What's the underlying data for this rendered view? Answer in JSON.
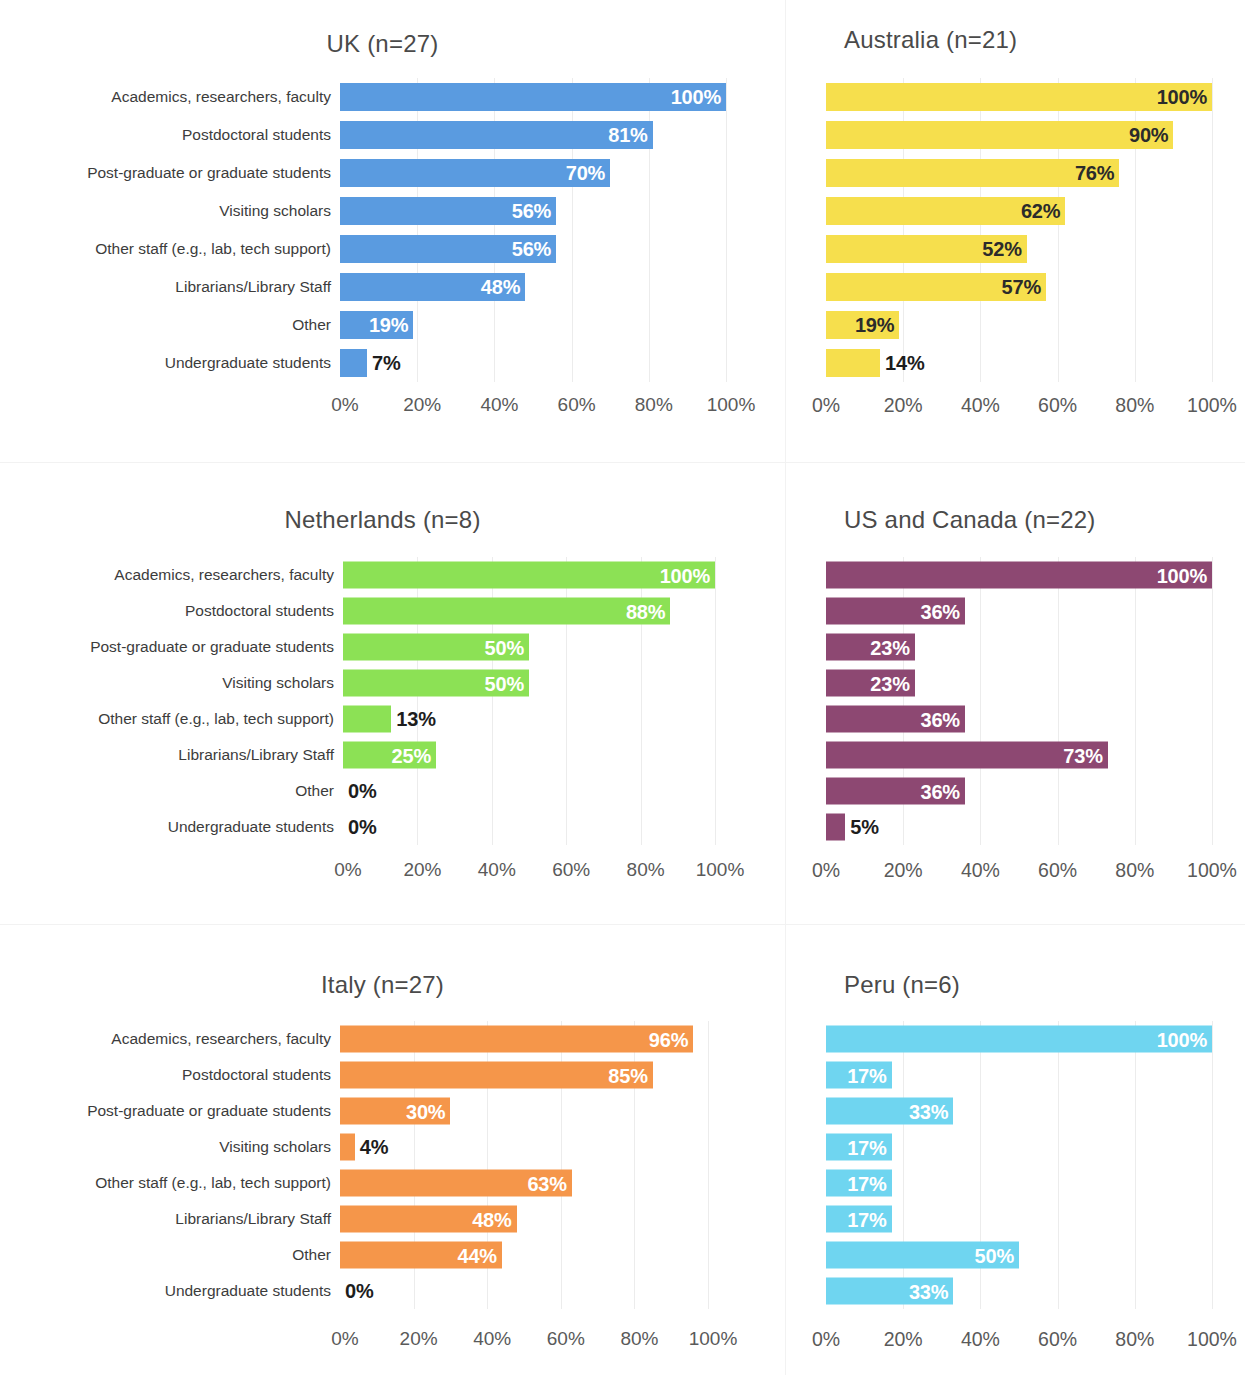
{
  "chart_data": {
    "type": "bar",
    "orientation": "horizontal",
    "title": "",
    "xlabel": "",
    "ylabel": "",
    "xlim": [
      0,
      100
    ],
    "xticks": [
      "0%",
      "20%",
      "40%",
      "60%",
      "80%",
      "100%"
    ],
    "xtick_values": [
      0,
      20,
      40,
      60,
      80,
      100
    ],
    "grid": "vertical-only",
    "legend": "none",
    "value_suffix": "%",
    "categories": [
      "Academics, researchers, faculty",
      "Postdoctoral students",
      "Post-graduate or graduate students",
      "Visiting scholars",
      "Other staff (e.g., lab, tech support)",
      "Librarians/Library Staff",
      "Other",
      "Undergraduate students"
    ],
    "panels": [
      {
        "title": "UK (n=27)",
        "region": "UK",
        "n": 27,
        "color": "#5a9be0",
        "label_color": "white",
        "values": [
          100,
          81,
          70,
          56,
          56,
          48,
          19,
          7
        ],
        "value_labels": [
          "100%",
          "81%",
          "70%",
          "56%",
          "56%",
          "48%",
          "19%",
          "7%"
        ]
      },
      {
        "title": "Australia (n=21)",
        "region": "Australia",
        "n": 21,
        "color": "#f6df4d",
        "label_color": "dark",
        "values": [
          100,
          90,
          76,
          62,
          52,
          57,
          19,
          14
        ],
        "value_labels": [
          "100%",
          "90%",
          "76%",
          "62%",
          "52%",
          "57%",
          "19%",
          "14%"
        ]
      },
      {
        "title": "Netherlands (n=8)",
        "region": "Netherlands",
        "n": 8,
        "color": "#8ce155",
        "label_color": "white",
        "values": [
          100,
          88,
          50,
          50,
          13,
          25,
          0,
          0
        ],
        "value_labels": [
          "100%",
          "88%",
          "50%",
          "50%",
          "13%",
          "25%",
          "0%",
          "0%"
        ]
      },
      {
        "title": "US and Canada (n=22)",
        "region": "US and Canada",
        "n": 22,
        "color": "#8d4872",
        "label_color": "white",
        "values": [
          100,
          36,
          23,
          23,
          36,
          73,
          36,
          5
        ],
        "value_labels": [
          "100%",
          "36%",
          "23%",
          "23%",
          "36%",
          "73%",
          "36%",
          "5%"
        ]
      },
      {
        "title": "Italy (n=27)",
        "region": "Italy",
        "n": 27,
        "color": "#f5964a",
        "label_color": "white",
        "values": [
          96,
          85,
          30,
          4,
          63,
          48,
          44,
          0
        ],
        "value_labels": [
          "96%",
          "85%",
          "30%",
          "4%",
          "63%",
          "48%",
          "44%",
          "0%"
        ]
      },
      {
        "title": "Peru (n=6)",
        "region": "Peru",
        "n": 6,
        "color": "#6fd5f0",
        "label_color": "white",
        "values": [
          100,
          17,
          33,
          17,
          17,
          17,
          50,
          33
        ],
        "value_labels": [
          "100%",
          "17%",
          "33%",
          "17%",
          "17%",
          "17%",
          "50%",
          "33%"
        ]
      }
    ]
  },
  "colors": {
    "uk": "#5a9be0",
    "australia": "#f6df4d",
    "netherlands": "#8ce155",
    "us_and_canada": "#8d4872",
    "italy": "#f5964a",
    "peru": "#6fd5f0",
    "gridline": "#ececec",
    "text": "#3c3c3c",
    "axis_text": "#5a5a5a"
  }
}
